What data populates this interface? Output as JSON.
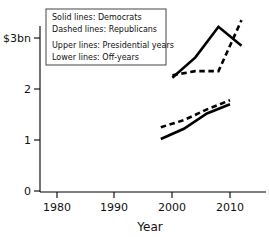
{
  "chart_data": {
    "type": "line",
    "title": "",
    "subtitle": "",
    "xlabel": "Year",
    "ylabel": "",
    "xlim": [
      1975,
      2015
    ],
    "ylim": [
      0,
      3.45
    ],
    "grid": false,
    "x_ticks": [
      1980,
      1990,
      2000,
      2010
    ],
    "x_tick_labels": [
      "1980",
      "1990",
      "2000",
      "2010"
    ],
    "y_ticks": [
      0,
      1,
      2,
      3
    ],
    "y_tick_labels": [
      "0",
      "1",
      "2",
      "$3bn"
    ],
    "legend_position": "top-left-inside",
    "legend_entries": [
      "Solid lines: Democrats",
      "Dashed lines: Republicans",
      "Upper lines: Presidential years",
      "Lower lines: Off-years"
    ],
    "series": [
      {
        "name": "Democrats - Presidential years",
        "style": "solid",
        "group": "upper",
        "x": [
          2000,
          2004,
          2008,
          2012
        ],
        "values": [
          2.22,
          2.62,
          3.22,
          2.85
        ]
      },
      {
        "name": "Republicans - Presidential years",
        "style": "dashed",
        "group": "upper",
        "x": [
          2000,
          2004,
          2008,
          2012
        ],
        "values": [
          2.27,
          2.35,
          2.35,
          3.35
        ]
      },
      {
        "name": "Democrats - Off-years",
        "style": "solid",
        "group": "lower",
        "x": [
          1998,
          2002,
          2006,
          2010
        ],
        "values": [
          1.02,
          1.22,
          1.52,
          1.7
        ]
      },
      {
        "name": "Republicans - Off-years",
        "style": "dashed",
        "group": "lower",
        "x": [
          1998,
          2002,
          2006,
          2010
        ],
        "values": [
          1.25,
          1.39,
          1.6,
          1.78
        ]
      }
    ]
  },
  "axis": {
    "x_title": "Year",
    "y_tick_0": "0",
    "y_tick_1": "1",
    "y_tick_2": "2",
    "y_tick_3": "$3bn",
    "x_tick_1980": "1980",
    "x_tick_1990": "1990",
    "x_tick_2000": "2000",
    "x_tick_2010": "2010"
  },
  "legend": {
    "line1": "Solid lines: Democrats",
    "line2": "Dashed lines: Republicans",
    "line3": "Upper lines: Presidential years",
    "line4": "Lower lines: Off-years"
  },
  "colors": {
    "ink": "#000000",
    "background": "#ffffff",
    "legend_border": "#444444"
  }
}
